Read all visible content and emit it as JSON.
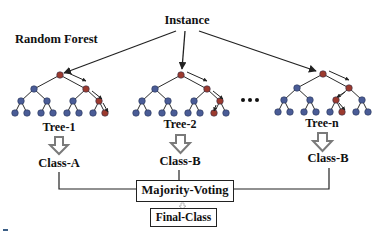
{
  "title_fragment": "Random Forest Simplified",
  "diagram": {
    "input_label": "Instance",
    "section_label": "Random Forest",
    "ellipsis": "...",
    "trees": [
      {
        "label": "Tree-1",
        "prediction": "Class-A"
      },
      {
        "label": "Tree-2",
        "prediction": "Class-B"
      },
      {
        "label": "Tree-n",
        "prediction": "Class-B"
      }
    ],
    "aggregator": "Majority-Voting",
    "output": "Final-Class"
  },
  "colors": {
    "node_default": "#4a5c96",
    "node_path": "#9c3a2e",
    "edge": "#2b2b2b",
    "down_arrow": "#8a8a8a",
    "box_border": "#222222"
  }
}
